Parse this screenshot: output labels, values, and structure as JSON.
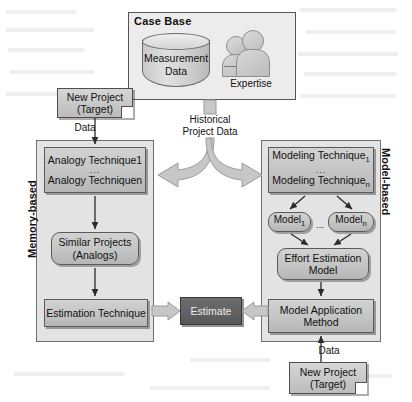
{
  "diagram": {
    "case_base": {
      "title": "Case Base",
      "database_label_line1": "Measurement",
      "database_label_line2": "Data",
      "expertise_label": "Expertise"
    },
    "flow_labels": {
      "historical_line1": "Historical",
      "historical_line2": "Project Data",
      "data_left": "Data",
      "data_right": "Data",
      "ellipsis": "..."
    },
    "left_panel": {
      "side_label": "Memory-based",
      "techniques_line1": "Analogy Technique1",
      "techniques_line2": "Analogy Techniquen",
      "similar_projects_line1": "Similar Projects",
      "similar_projects_line2": "(Analogs)",
      "estimation_technique": "Estimation Technique",
      "new_project_line1": "New Project",
      "new_project_line2": "(Target)"
    },
    "right_panel": {
      "side_label": "Model-based",
      "techniques_line1": "Modeling Technique",
      "techniques_line1_sub": "1",
      "techniques_line2": "Modeling Technique",
      "techniques_line2_sub": "n",
      "model_first": "Model",
      "model_first_sub": "1",
      "model_last": "Model",
      "model_last_sub": "n",
      "models_ellipsis": "...",
      "effort_model_line1": "Effort Estimation",
      "effort_model_line2": "Model",
      "application_method_line1": "Model Application",
      "application_method_line2": "Method",
      "new_project_line1": "New Project",
      "new_project_line2": "(Target)"
    },
    "center": {
      "estimate": "Estimate"
    },
    "colors": {
      "panel_fill": "#e3e3e3",
      "node_fill": "#c4c4c4",
      "estimate_fill": "#616161",
      "estimate_text": "#ededed",
      "border": "#5a5a5a",
      "arrow_fill": "#bdbdbd",
      "page_background": "#ffffff"
    }
  }
}
